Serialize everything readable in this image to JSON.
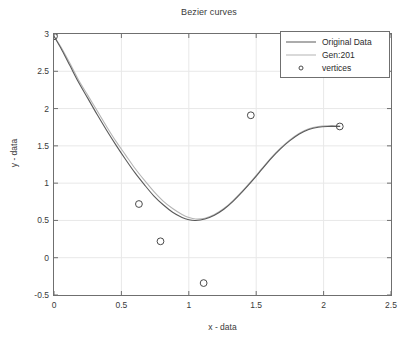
{
  "chart_data": {
    "type": "line",
    "title": "Bezier curves",
    "xlabel": "x - data",
    "ylabel": "y - data",
    "xlim": [
      0,
      2.5
    ],
    "ylim": [
      -0.5,
      3
    ],
    "grid": true,
    "legend_position": "top-right",
    "xticks": [
      "0",
      "0.5",
      "1",
      "1.5",
      "2",
      "2.5"
    ],
    "xtick_values": [
      0,
      0.5,
      1,
      1.5,
      2,
      2.5
    ],
    "yticks": [
      "-0.5",
      "0",
      "0.5",
      "1",
      "1.5",
      "2",
      "2.5",
      "3"
    ],
    "ytick_values": [
      -0.5,
      0,
      0.5,
      1,
      1.5,
      2,
      2.5,
      3
    ],
    "series": [
      {
        "name": "Original Data",
        "type": "line",
        "color": "#5a5a5a",
        "points": [
          [
            0.0,
            2.97
          ],
          [
            0.06,
            2.78
          ],
          [
            0.12,
            2.57
          ],
          [
            0.18,
            2.36
          ],
          [
            0.25,
            2.14
          ],
          [
            0.32,
            1.92
          ],
          [
            0.39,
            1.71
          ],
          [
            0.46,
            1.51
          ],
          [
            0.53,
            1.32
          ],
          [
            0.6,
            1.14
          ],
          [
            0.67,
            0.98
          ],
          [
            0.74,
            0.83
          ],
          [
            0.81,
            0.71
          ],
          [
            0.88,
            0.61
          ],
          [
            0.95,
            0.54
          ],
          [
            1.0,
            0.51
          ],
          [
            1.05,
            0.5
          ],
          [
            1.12,
            0.52
          ],
          [
            1.19,
            0.57
          ],
          [
            1.26,
            0.65
          ],
          [
            1.33,
            0.76
          ],
          [
            1.4,
            0.89
          ],
          [
            1.47,
            1.03
          ],
          [
            1.54,
            1.18
          ],
          [
            1.61,
            1.33
          ],
          [
            1.68,
            1.46
          ],
          [
            1.75,
            1.57
          ],
          [
            1.82,
            1.66
          ],
          [
            1.89,
            1.72
          ],
          [
            1.96,
            1.75
          ],
          [
            2.03,
            1.76
          ],
          [
            2.12,
            1.76
          ]
        ]
      },
      {
        "name": "Gen:201",
        "type": "line",
        "color": "#b4b4b4",
        "points": [
          [
            0.0,
            2.97
          ],
          [
            0.06,
            2.8
          ],
          [
            0.12,
            2.6
          ],
          [
            0.18,
            2.39
          ],
          [
            0.25,
            2.18
          ],
          [
            0.32,
            1.97
          ],
          [
            0.39,
            1.76
          ],
          [
            0.46,
            1.56
          ],
          [
            0.53,
            1.38
          ],
          [
            0.6,
            1.2
          ],
          [
            0.67,
            1.04
          ],
          [
            0.74,
            0.89
          ],
          [
            0.81,
            0.76
          ],
          [
            0.88,
            0.66
          ],
          [
            0.95,
            0.58
          ],
          [
            1.0,
            0.54
          ],
          [
            1.05,
            0.52
          ],
          [
            1.12,
            0.53
          ],
          [
            1.19,
            0.58
          ],
          [
            1.26,
            0.66
          ],
          [
            1.33,
            0.77
          ],
          [
            1.4,
            0.9
          ],
          [
            1.47,
            1.04
          ],
          [
            1.54,
            1.19
          ],
          [
            1.61,
            1.34
          ],
          [
            1.68,
            1.47
          ],
          [
            1.75,
            1.58
          ],
          [
            1.82,
            1.67
          ],
          [
            1.89,
            1.73
          ],
          [
            1.96,
            1.76
          ],
          [
            2.03,
            1.77
          ],
          [
            2.12,
            1.77
          ]
        ]
      },
      {
        "name": "vertices",
        "type": "scatter",
        "marker": "circle-open",
        "color": "#4a4a4a",
        "points": [
          [
            0.0,
            2.97
          ],
          [
            0.63,
            0.72
          ],
          [
            0.79,
            0.22
          ],
          [
            1.11,
            -0.34
          ],
          [
            1.46,
            1.91
          ],
          [
            2.12,
            1.76
          ]
        ]
      }
    ],
    "legend_entries": [
      {
        "label": "Original Data",
        "kind": "line",
        "color": "#5a5a5a"
      },
      {
        "label": "Gen:201",
        "kind": "line",
        "color": "#b4b4b4"
      },
      {
        "label": "vertices",
        "kind": "marker",
        "color": "#4a4a4a"
      }
    ]
  }
}
